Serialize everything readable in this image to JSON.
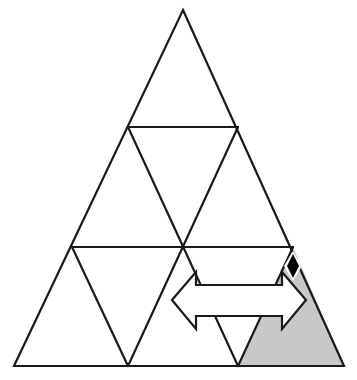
{
  "canvas": {
    "width": 357,
    "height": 380,
    "background": "#ffffff"
  },
  "figure": {
    "title": "Subdivided equilateral triangle with shaded corner cell, double-headed arrow and diamond marker",
    "stroke_color": "#1a1a1a",
    "stroke_width": 2.2,
    "fill_color": "#ffffff",
    "shade_color": "#c8c8c8",
    "marker_color": "#000000"
  },
  "chart_data": {
    "type": "diagram",
    "title": "Subdivided equilateral triangle",
    "subdivision_rows": 3,
    "cell_count": 9,
    "outer_triangle": {
      "apex": [
        183,
        10
      ],
      "bottom_left": [
        14,
        366
      ],
      "bottom_right": [
        344,
        366
      ]
    },
    "row_lines_y": [
      127,
      247,
      366
    ],
    "horizontal_dividers": [
      {
        "y": 127,
        "x1": 128,
        "x2": 238
      },
      {
        "y": 247,
        "x1": 72,
        "x2": 293
      }
    ],
    "grid_nodes": {
      "row0": [
        [
          183,
          10
        ]
      ],
      "row1": [
        [
          128,
          127
        ],
        [
          238,
          127
        ]
      ],
      "row2": [
        [
          72,
          247
        ],
        [
          183,
          247
        ],
        [
          293,
          247
        ]
      ],
      "row3": [
        [
          14,
          366
        ],
        [
          128,
          366
        ],
        [
          238,
          366
        ],
        [
          344,
          366
        ]
      ]
    },
    "shaded_cell": {
      "label": "bottom-right corner cell",
      "vertices": [
        [
          238,
          366
        ],
        [
          344,
          366
        ],
        [
          293,
          247
        ]
      ],
      "fill": "#c8c8c8"
    },
    "arrow": {
      "type": "double-headed-horizontal",
      "left_tip": [
        172,
        300
      ],
      "right_tip": [
        306,
        300
      ],
      "shaft_top_y": 285,
      "shaft_bottom_y": 316,
      "head_top_y": 272,
      "head_bottom_y": 329,
      "head_base_x_left": 196,
      "head_base_x_right": 282,
      "fill": "#ffffff",
      "stroke": "#1a1a1a"
    },
    "diamond_marker": {
      "center": [
        293,
        266
      ],
      "half_width": 6,
      "half_height": 12,
      "fill": "#000000",
      "halo_fill": "#ffffff"
    }
  }
}
